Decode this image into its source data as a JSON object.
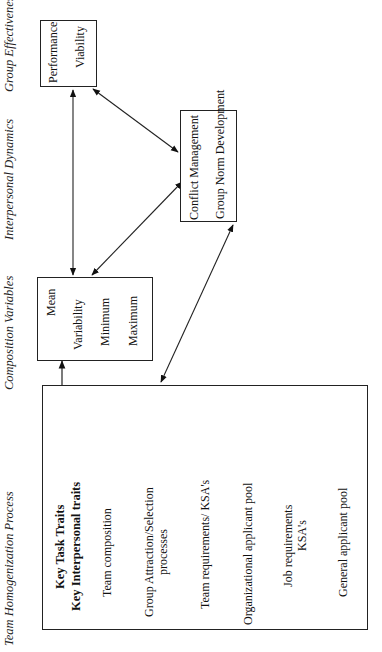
{
  "columns": {
    "homogenization": "Team Homogenization Process",
    "composition": "Composition Variables",
    "dynamics": "Interpersonal Dynamics",
    "effectiveness": "Group Effectiveness"
  },
  "homogenization_box": {
    "key_traits": [
      "Key Task Traits",
      "Key Interpersonal traits"
    ],
    "steps": [
      "Team composition",
      "Group Attraction/Selection",
      "processes",
      "Team requirements/ KSA's",
      "Organizational applicant pool",
      "Job requirements",
      "KSA's",
      "General applicant pool"
    ]
  },
  "composition_box": {
    "items": [
      "Mean",
      "Variability",
      "Minimum",
      "Maximum"
    ]
  },
  "dynamics_box": {
    "items": [
      "Conflict Management",
      "Group Norm Development"
    ]
  },
  "effectiveness_box": {
    "items": [
      "Performance",
      "Viability"
    ]
  },
  "connections": [
    {
      "from": "homogenization_box",
      "to": "composition_box",
      "type": "one-way"
    },
    {
      "from": "homogenization_box",
      "to": "dynamics_box",
      "type": "two-way"
    },
    {
      "from": "composition_box",
      "to": "effectiveness_box",
      "type": "two-way"
    },
    {
      "from": "composition_box",
      "to": "dynamics_box",
      "type": "two-way"
    },
    {
      "from": "dynamics_box",
      "to": "effectiveness_box",
      "type": "two-way"
    }
  ]
}
